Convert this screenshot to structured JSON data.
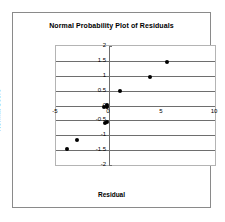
{
  "chart_data": {
    "type": "scatter",
    "title": "Normal Probability Plot of Residuals",
    "xlabel": "Residual",
    "ylabel": "Normal Score",
    "xlim": [
      -5,
      10
    ],
    "ylim": [
      -2,
      2
    ],
    "grid": true,
    "legend": false,
    "x_ticks": [
      {
        "value": -5,
        "label": "-5"
      },
      {
        "value": 0,
        "label": "0"
      },
      {
        "value": 5,
        "label": "5"
      },
      {
        "value": 10,
        "label": "10"
      }
    ],
    "y_ticks": [
      {
        "value": 2,
        "label": "2"
      },
      {
        "value": 1.5,
        "label": "1.5"
      },
      {
        "value": 1,
        "label": "1"
      },
      {
        "value": 0.5,
        "label": "0.5"
      },
      {
        "value": 0,
        "label": "0"
      },
      {
        "value": -0.5,
        "label": "-0.5"
      },
      {
        "value": -1,
        "label": "-1"
      },
      {
        "value": -1.5,
        "label": "-1.5"
      },
      {
        "value": -2,
        "label": "-2"
      }
    ],
    "series": [
      {
        "name": "Residuals",
        "marker": "filled-circle",
        "color": "#000000",
        "points": [
          {
            "x": -4.0,
            "y": -1.45
          },
          {
            "x": -3.0,
            "y": -1.15
          },
          {
            "x": -0.35,
            "y": -0.6
          },
          {
            "x": -0.2,
            "y": -0.55
          },
          {
            "x": -0.5,
            "y": -0.05
          },
          {
            "x": -0.15,
            "y": -0.05
          },
          {
            "x": -0.2,
            "y": 0.02
          },
          {
            "x": 1.0,
            "y": 0.5
          },
          {
            "x": 3.9,
            "y": 0.95
          },
          {
            "x": 5.5,
            "y": 1.45
          }
        ]
      }
    ]
  }
}
